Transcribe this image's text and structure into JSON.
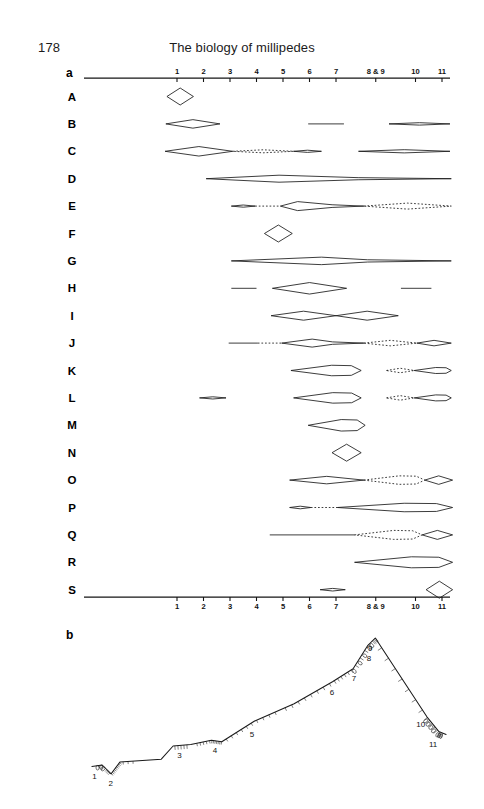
{
  "page": {
    "folio": "178",
    "running_title": "The biology of millipedes",
    "width": 484,
    "height": 809,
    "ink_color": "#1a1a1a",
    "background": "#ffffff"
  },
  "panels": [
    {
      "id": "a",
      "label": "a"
    },
    {
      "id": "b",
      "label": "b"
    }
  ],
  "chart_data": {
    "type": "diagram",
    "title": "The biology of millipedes",
    "panel_a": {
      "type": "range-spindle-chart",
      "description": "Nineteen taxon rows (A-S) plotted against a shared horizontal stage/zone axis numbered 1 to 11; each row shows lens, diamond and spindle shapes marking occupied intervals, with dotted outlines marking inferred or uncertain intervals.",
      "axis": {
        "orientation": "horizontal",
        "tick_labels": [
          "1",
          "2",
          "3",
          "4",
          "5",
          "6",
          "7",
          "8 & 9",
          "10",
          "11"
        ],
        "tick_values": [
          1,
          2,
          3,
          4,
          5,
          6,
          7,
          8.5,
          10,
          11
        ],
        "min": 0.1,
        "max": 11.8,
        "shown_top": true,
        "shown_bottom": true,
        "grid": false
      },
      "row_labels": [
        "A",
        "B",
        "C",
        "D",
        "E",
        "F",
        "G",
        "H",
        "I",
        "J",
        "K",
        "L",
        "M",
        "N",
        "O",
        "P",
        "Q",
        "R",
        "S"
      ],
      "rows": [
        {
          "label": "A",
          "shapes": [
            {
              "kind": "diamond",
              "x0": 0.62,
              "x1": 1.62,
              "thickness": 17,
              "style": "solid"
            }
          ]
        },
        {
          "label": "B",
          "shapes": [
            {
              "kind": "lens",
              "x0": 0.58,
              "x1": 2.62,
              "thickness": 8.5,
              "style": "solid"
            },
            {
              "kind": "line",
              "x0": 5.95,
              "x1": 7.3,
              "thickness": 0.6,
              "style": "solid"
            },
            {
              "kind": "lens",
              "x0": 9.0,
              "x1": 11.3,
              "thickness": 2.4,
              "style": "solid"
            }
          ]
        },
        {
          "label": "C",
          "shapes": [
            {
              "kind": "diamond",
              "x0": 0.55,
              "x1": 3.1,
              "thickness": 9.5,
              "style": "solid"
            },
            {
              "kind": "lens-dotted",
              "x0": 3.1,
              "x1": 5.4,
              "thickness": 3.0,
              "style": "dotted"
            },
            {
              "kind": "lens",
              "x0": 5.4,
              "x1": 6.45,
              "thickness": 2.2,
              "style": "solid"
            },
            {
              "kind": "lens",
              "x0": 7.85,
              "x1": 11.3,
              "thickness": 3.2,
              "style": "solid"
            }
          ]
        },
        {
          "label": "D",
          "shapes": [
            {
              "kind": "spindle",
              "x0": 2.1,
              "x1": 11.35,
              "peak": 4.85,
              "thickness": 7.0,
              "style": "solid"
            }
          ]
        },
        {
          "label": "E",
          "shapes": [
            {
              "kind": "lens",
              "x0": 3.05,
              "x1": 3.95,
              "thickness": 2.2,
              "style": "solid"
            },
            {
              "kind": "line-dotted",
              "x0": 3.95,
              "x1": 4.9,
              "thickness": 0.6,
              "style": "dotted"
            },
            {
              "kind": "spindle",
              "x0": 4.9,
              "x1": 8.05,
              "peak": 5.55,
              "thickness": 9.0,
              "style": "solid"
            },
            {
              "kind": "lens-dotted",
              "x0": 8.05,
              "x1": 11.35,
              "thickness": 6.0,
              "style": "dotted"
            }
          ]
        },
        {
          "label": "F",
          "shapes": [
            {
              "kind": "diamond",
              "x0": 4.3,
              "x1": 5.35,
              "thickness": 17,
              "style": "solid"
            }
          ]
        },
        {
          "label": "G",
          "shapes": [
            {
              "kind": "spindle",
              "x0": 3.05,
              "x1": 11.35,
              "peak": 6.45,
              "thickness": 7.5,
              "style": "solid"
            }
          ]
        },
        {
          "label": "H",
          "shapes": [
            {
              "kind": "line",
              "x0": 3.05,
              "x1": 4.0,
              "thickness": 0.6,
              "style": "solid"
            },
            {
              "kind": "diamond",
              "x0": 4.6,
              "x1": 7.4,
              "thickness": 11.5,
              "style": "solid"
            },
            {
              "kind": "line",
              "x0": 9.45,
              "x1": 10.6,
              "thickness": 0.6,
              "style": "solid"
            }
          ]
        },
        {
          "label": "I",
          "shapes": [
            {
              "kind": "diamond",
              "x0": 4.55,
              "x1": 7.0,
              "thickness": 9.0,
              "style": "solid"
            },
            {
              "kind": "diamond",
              "x0": 7.0,
              "x1": 9.35,
              "thickness": 9.0,
              "style": "solid"
            }
          ]
        },
        {
          "label": "J",
          "shapes": [
            {
              "kind": "line",
              "x0": 2.95,
              "x1": 4.05,
              "thickness": 0.6,
              "style": "solid"
            },
            {
              "kind": "line-dotted",
              "x0": 4.05,
              "x1": 4.95,
              "thickness": 0.6,
              "style": "dotted"
            },
            {
              "kind": "spindle",
              "x0": 4.95,
              "x1": 8.05,
              "peak": 6.1,
              "thickness": 8.0,
              "style": "solid"
            },
            {
              "kind": "lens-dotted",
              "x0": 8.05,
              "x1": 10.05,
              "thickness": 5.5,
              "style": "dotted"
            },
            {
              "kind": "lens",
              "x0": 10.05,
              "x1": 11.35,
              "thickness": 5.5,
              "style": "solid"
            }
          ]
        },
        {
          "label": "K",
          "shapes": [
            {
              "kind": "wedge",
              "x0": 5.3,
              "x1": 7.95,
              "thickness": 10.5,
              "style": "solid"
            },
            {
              "kind": "lens-dotted",
              "x0": 8.9,
              "x1": 9.95,
              "thickness": 4.5,
              "style": "dotted"
            },
            {
              "kind": "wedge",
              "x0": 9.95,
              "x1": 11.35,
              "thickness": 6.0,
              "style": "solid"
            }
          ]
        },
        {
          "label": "L",
          "shapes": [
            {
              "kind": "lens",
              "x0": 1.85,
              "x1": 2.85,
              "thickness": 2.2,
              "style": "solid"
            },
            {
              "kind": "wedge",
              "x0": 5.4,
              "x1": 7.95,
              "thickness": 10.5,
              "style": "solid"
            },
            {
              "kind": "lens-dotted",
              "x0": 8.9,
              "x1": 9.95,
              "thickness": 4.5,
              "style": "dotted"
            },
            {
              "kind": "wedge",
              "x0": 9.95,
              "x1": 11.35,
              "thickness": 6.0,
              "style": "solid"
            }
          ]
        },
        {
          "label": "M",
          "shapes": [
            {
              "kind": "wedge",
              "x0": 5.95,
              "x1": 8.1,
              "thickness": 11.5,
              "style": "solid"
            }
          ]
        },
        {
          "label": "N",
          "shapes": [
            {
              "kind": "diamond",
              "x0": 6.85,
              "x1": 7.95,
              "thickness": 17,
              "style": "solid"
            }
          ]
        },
        {
          "label": "O",
          "shapes": [
            {
              "kind": "diamond",
              "x0": 5.25,
              "x1": 8.05,
              "thickness": 7.5,
              "style": "solid"
            },
            {
              "kind": "wedge-dotted",
              "x0": 8.05,
              "x1": 10.35,
              "thickness": 8.5,
              "style": "dotted"
            },
            {
              "kind": "lens",
              "x0": 10.35,
              "x1": 11.4,
              "thickness": 8.5,
              "style": "solid"
            }
          ]
        },
        {
          "label": "P",
          "shapes": [
            {
              "kind": "lens",
              "x0": 5.25,
              "x1": 6.05,
              "thickness": 2.6,
              "style": "solid"
            },
            {
              "kind": "line-dotted",
              "x0": 6.05,
              "x1": 7.05,
              "thickness": 0.6,
              "style": "dotted"
            },
            {
              "kind": "wedge",
              "x0": 7.05,
              "x1": 11.4,
              "thickness": 8.5,
              "style": "solid"
            }
          ]
        },
        {
          "label": "Q",
          "shapes": [
            {
              "kind": "line",
              "x0": 4.5,
              "x1": 7.7,
              "thickness": 0.6,
              "style": "solid"
            },
            {
              "kind": "wedge-dotted",
              "x0": 7.7,
              "x1": 10.25,
              "thickness": 9.0,
              "style": "dotted"
            },
            {
              "kind": "lens",
              "x0": 10.25,
              "x1": 11.4,
              "thickness": 9.0,
              "style": "solid"
            }
          ]
        },
        {
          "label": "R",
          "shapes": [
            {
              "kind": "wedge",
              "x0": 7.7,
              "x1": 11.4,
              "thickness": 11.0,
              "style": "solid"
            }
          ]
        },
        {
          "label": "S",
          "shapes": [
            {
              "kind": "lens",
              "x0": 6.4,
              "x1": 7.35,
              "thickness": 2.6,
              "style": "solid"
            },
            {
              "kind": "diamond",
              "x0": 10.4,
              "x1": 11.4,
              "thickness": 17,
              "style": "solid"
            }
          ]
        }
      ]
    },
    "panel_b": {
      "type": "profile-line",
      "description": "A single rising-and-falling profile line (a transect/ridge silhouette) bearing small hatch and loop ornaments, annotated with segment numbers 1 to 11 running up the ascending limb to the peak and down the descending limb.",
      "segment_labels": [
        "1",
        "2",
        "3",
        "4",
        "5",
        "6",
        "7",
        "8",
        "9",
        "10",
        "11"
      ],
      "peak_segment": "9",
      "profile_points": [
        {
          "x": 0.2,
          "y": 0.12
        },
        {
          "x": 0.55,
          "y": 0.13
        },
        {
          "x": 0.85,
          "y": 0.07
        },
        {
          "x": 1.15,
          "y": 0.15
        },
        {
          "x": 2.55,
          "y": 0.17
        },
        {
          "x": 2.95,
          "y": 0.26
        },
        {
          "x": 3.55,
          "y": 0.27
        },
        {
          "x": 4.25,
          "y": 0.3
        },
        {
          "x": 4.6,
          "y": 0.29
        },
        {
          "x": 5.7,
          "y": 0.43
        },
        {
          "x": 7.05,
          "y": 0.55
        },
        {
          "x": 8.35,
          "y": 0.7
        },
        {
          "x": 9.05,
          "y": 0.79
        },
        {
          "x": 9.55,
          "y": 0.95
        },
        {
          "x": 9.8,
          "y": 1.0
        },
        {
          "x": 11.55,
          "y": 0.46
        },
        {
          "x": 11.95,
          "y": 0.36
        },
        {
          "x": 12.2,
          "y": 0.34
        }
      ]
    }
  }
}
